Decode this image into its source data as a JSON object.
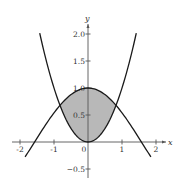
{
  "chart_data": {
    "type": "line",
    "title": "",
    "xlabel": "x",
    "ylabel": "y",
    "xlim": [
      -2.2,
      2.2
    ],
    "ylim": [
      -0.6,
      2.15
    ],
    "x_ticks": [
      -2,
      -1,
      0,
      1,
      2
    ],
    "x_tick_labels": [
      "-2",
      "-1",
      "0",
      "1",
      "2"
    ],
    "y_ticks": [
      2.0,
      1.5,
      1.0,
      0.5,
      -0.5
    ],
    "y_tick_labels": [
      "2.0",
      "1.5",
      "1.0",
      "0.5",
      "-0.5"
    ],
    "grid": false,
    "legend": null,
    "series": [
      {
        "name": "y = x^2",
        "description": "upward parabola through origin",
        "x_range": [
          -1.42,
          1.42
        ],
        "x": [
          -1.4,
          -1.0,
          -0.82,
          -0.5,
          0,
          0.5,
          0.82,
          1.0,
          1.4
        ],
        "values": [
          1.96,
          1.0,
          0.67,
          0.25,
          0,
          0.25,
          0.67,
          1.0,
          1.96
        ]
      },
      {
        "name": "y = cos x",
        "description": "downward curve peaking at 1 at x=0",
        "x_range": [
          -1.85,
          1.85
        ],
        "x": [
          -1.85,
          -1.57,
          -1.0,
          -0.82,
          -0.5,
          0,
          0.5,
          0.82,
          1.0,
          1.57,
          1.85
        ],
        "values": [
          -0.28,
          0.0,
          0.54,
          0.68,
          0.88,
          1.0,
          0.88,
          0.68,
          0.54,
          0.0,
          -0.28
        ]
      }
    ],
    "shaded_region": {
      "description": "region between y = cos x (top) and y = x^2 (bottom)",
      "x_range": [
        -0.824,
        0.824
      ],
      "color": "#b8b8b8"
    },
    "intersections": [
      {
        "x": -0.824,
        "y": 0.679
      },
      {
        "x": 0.824,
        "y": 0.679
      }
    ],
    "labels": {
      "x_axis": "x",
      "y_axis": "y",
      "origin": "0"
    }
  },
  "colors": {
    "curve": "#1a1a1a",
    "axis": "#555555",
    "shade": "#b8b8b8",
    "text": "#333333"
  }
}
